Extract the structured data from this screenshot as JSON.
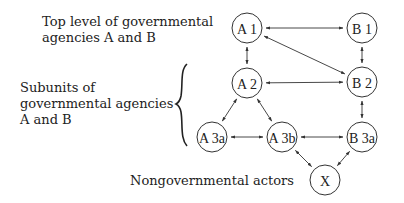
{
  "labels": {
    "top_level": [
      "Top level of governmental",
      "agencies A and B"
    ],
    "subunits": [
      "Subunits of",
      "governmental agencies",
      "A and B"
    ],
    "nongovernmental": "Nongovernmental  actors"
  },
  "nodes": [
    {
      "id": "A1",
      "label": "A 1",
      "x": 247,
      "y": 28
    },
    {
      "id": "B1",
      "label": "B 1",
      "x": 362,
      "y": 28
    },
    {
      "id": "A2",
      "label": "A 2",
      "x": 247,
      "y": 83
    },
    {
      "id": "B2",
      "label": "B 2",
      "x": 362,
      "y": 82
    },
    {
      "id": "A3a",
      "label": "A 3a",
      "x": 212,
      "y": 137
    },
    {
      "id": "A3b",
      "label": "A 3b",
      "x": 282,
      "y": 137
    },
    {
      "id": "B3a",
      "label": "B 3a",
      "x": 362,
      "y": 137
    },
    {
      "id": "X",
      "label": "X",
      "x": 325,
      "y": 180
    }
  ],
  "edges": [
    {
      "from": "A1",
      "to": "B1",
      "bidirectional": true
    },
    {
      "from": "A1",
      "to": "A2",
      "bidirectional": true
    },
    {
      "from": "A1",
      "to": "B2",
      "bidirectional": true
    },
    {
      "from": "B1",
      "to": "B2",
      "bidirectional": true
    },
    {
      "from": "A2",
      "to": "B2",
      "bidirectional": true
    },
    {
      "from": "A2",
      "to": "A3a",
      "bidirectional": true
    },
    {
      "from": "A2",
      "to": "A3b",
      "bidirectional": true
    },
    {
      "from": "B2",
      "to": "B3a",
      "bidirectional": true
    },
    {
      "from": "A3a",
      "to": "A3b",
      "bidirectional": true
    },
    {
      "from": "A3b",
      "to": "B3a",
      "bidirectional": true
    },
    {
      "from": "A3b",
      "to": "X",
      "bidirectional": true
    },
    {
      "from": "B3a",
      "to": "X",
      "bidirectional": true
    }
  ]
}
